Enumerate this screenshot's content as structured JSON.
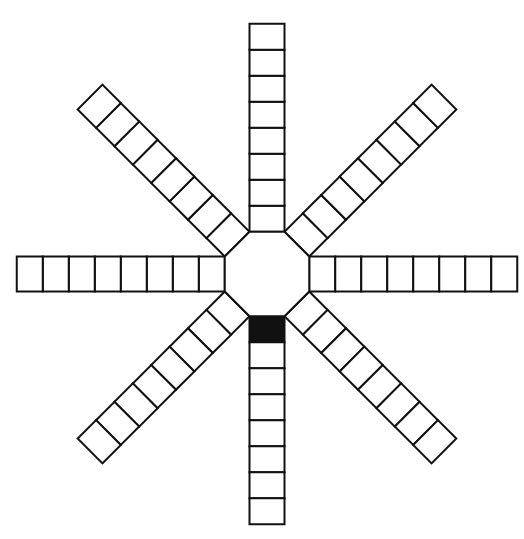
{
  "diagram": {
    "type": "radial-track-board",
    "center": [
      267,
      274
    ],
    "hub": {
      "shape": "octagon",
      "side": 35
    },
    "cell_size": 26,
    "arms": [
      {
        "name": "top",
        "angle": -90,
        "cells": 8,
        "filled": []
      },
      {
        "name": "top-right",
        "angle": -45,
        "cells": 8,
        "filled": []
      },
      {
        "name": "right",
        "angle": 0,
        "cells": 8,
        "filled": []
      },
      {
        "name": "bottom-right",
        "angle": 45,
        "cells": 8,
        "filled": []
      },
      {
        "name": "bottom",
        "angle": 90,
        "cells": 8,
        "filled": [
          0
        ]
      },
      {
        "name": "bottom-left",
        "angle": 135,
        "cells": 8,
        "filled": []
      },
      {
        "name": "left",
        "angle": 180,
        "cells": 8,
        "filled": []
      },
      {
        "name": "top-left",
        "angle": -135,
        "cells": 8,
        "filled": []
      }
    ],
    "colors": {
      "line": "#111111",
      "fill": "#ffffff",
      "marked": "#111111"
    }
  }
}
